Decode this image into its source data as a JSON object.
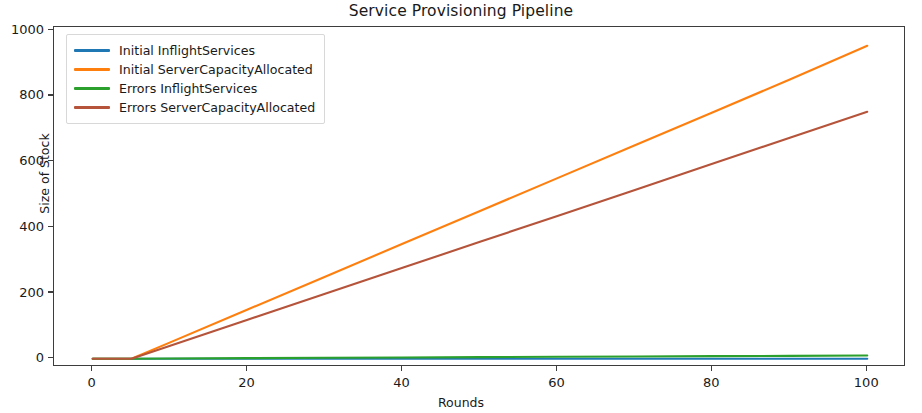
{
  "chart_data": {
    "type": "line",
    "title": "Service Provisioning Pipeline",
    "xlabel": "Rounds",
    "ylabel": "Size of Stock",
    "xlim": [
      -5,
      105
    ],
    "ylim": [
      -25,
      1010
    ],
    "xticks": [
      "0",
      "20",
      "40",
      "60",
      "80",
      "100"
    ],
    "xtick_values": [
      0,
      20,
      40,
      60,
      80,
      100
    ],
    "yticks": [
      "0",
      "200",
      "400",
      "600",
      "800",
      "1000"
    ],
    "ytick_values": [
      0,
      200,
      400,
      600,
      800,
      1000
    ],
    "grid": false,
    "legend_position": "upper left",
    "x": [
      0,
      5,
      10,
      20,
      30,
      40,
      50,
      60,
      70,
      80,
      90,
      100
    ],
    "series": [
      {
        "name": "Initial InflightServices",
        "color": "#1f77b4",
        "values": [
          0,
          0,
          0,
          0,
          0,
          0,
          0,
          0,
          0,
          0,
          0,
          0
        ]
      },
      {
        "name": "Initial ServerCapacityAllocated",
        "color": "#ff7f0e",
        "values": [
          0,
          0,
          50,
          150,
          250,
          350,
          450,
          550,
          650,
          750,
          850,
          953
        ]
      },
      {
        "name": "Errors InflightServices",
        "color": "#2ca02c",
        "values": [
          0,
          0,
          1,
          2,
          3,
          4,
          5,
          6,
          7,
          8,
          9,
          10
        ]
      },
      {
        "name": "Errors ServerCapacityAllocated",
        "color": "#b5543a",
        "values": [
          0,
          0,
          40,
          119,
          198,
          277,
          356,
          435,
          514,
          594,
          673,
          752
        ]
      }
    ]
  },
  "legend": {
    "items": [
      {
        "label": "Initial InflightServices",
        "color": "#1f77b4"
      },
      {
        "label": "Initial ServerCapacityAllocated",
        "color": "#ff7f0e"
      },
      {
        "label": "Errors InflightServices",
        "color": "#2ca02c"
      },
      {
        "label": "Errors ServerCapacityAllocated",
        "color": "#b5543a"
      }
    ]
  },
  "axes": {
    "title": "Service Provisioning Pipeline",
    "xlabel": "Rounds",
    "ylabel": "Size of Stock"
  }
}
